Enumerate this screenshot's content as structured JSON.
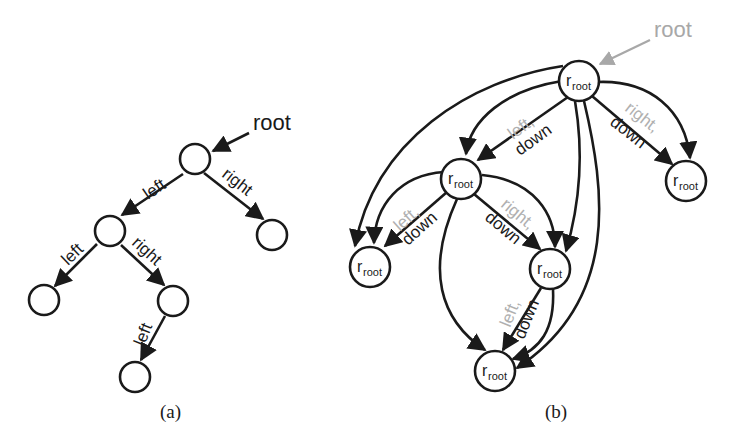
{
  "figure": {
    "panel_a": {
      "caption": "(a)",
      "root_label": "root",
      "edge_labels": {
        "root_left": "left",
        "root_right": "right",
        "l_left": "left",
        "l_right": "right",
        "lr_left": "left"
      }
    },
    "panel_b": {
      "caption": "(b)",
      "root_label": "root",
      "node_label_main": "r",
      "node_label_sub": "root",
      "edge_labels": {
        "top_left_gray": "left,",
        "top_left_black": "down",
        "top_right_gray": "right,",
        "top_right_black": "down",
        "mid_left_gray": "left,",
        "mid_left_black": "down",
        "mid_right_gray": "right,",
        "mid_right_black": "down",
        "lower_gray": "left,",
        "lower_black": "down"
      }
    },
    "colors": {
      "ink": "#1a1a1a",
      "gray_label": "#b0b0b0"
    }
  }
}
